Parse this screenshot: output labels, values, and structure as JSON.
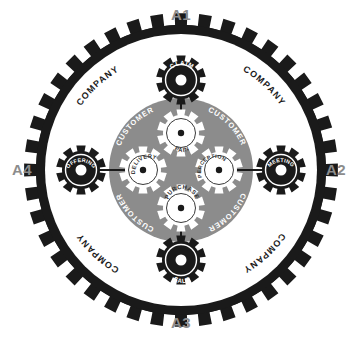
{
  "diagram": {
    "axis_labels": [
      {
        "id": "A1",
        "text": "A1",
        "position": "top"
      },
      {
        "id": "A2",
        "text": "A2",
        "position": "right"
      },
      {
        "id": "A3",
        "text": "A3",
        "position": "bottom"
      },
      {
        "id": "A4",
        "text": "A4",
        "position": "left"
      }
    ],
    "outer_ring": {
      "label": "COMPANY",
      "occurrences": 4,
      "labels": [
        "COMPANY",
        "COMPANY",
        "COMPANY",
        "COMPANY"
      ],
      "color": "#1a1a1a",
      "fill": "#ffffff"
    },
    "inner_ring": {
      "label": "CUSTOMER",
      "occurrences": 4,
      "labels": [
        "CUSTOMER",
        "CUSTOMER",
        "CUSTOMER",
        "CUSTOMER"
      ],
      "color": "#8c8c8c",
      "text_color": "#ffffff"
    },
    "outer_gears": [
      {
        "id": "claim",
        "label": "CLAIM",
        "position": "top",
        "color": "#1a1a1a"
      },
      {
        "id": "meeting",
        "label": "MEETING",
        "position": "right",
        "color": "#1a1a1a"
      },
      {
        "id": "sale",
        "label": "SALE",
        "position": "bottom",
        "color": "#1a1a1a"
      },
      {
        "id": "offering",
        "label": "OFFERING",
        "position": "left",
        "color": "#1a1a1a"
      }
    ],
    "inner_gears": [
      {
        "id": "pain",
        "label": "PAIN",
        "position": "top",
        "color": "#ffffff"
      },
      {
        "id": "perception",
        "label": "PERCEPTION",
        "position": "right",
        "color": "#ffffff"
      },
      {
        "id": "purchase",
        "label": "PURCHASE",
        "position": "bottom",
        "color": "#ffffff"
      },
      {
        "id": "delivery",
        "label": "DELIVERY",
        "position": "left",
        "color": "#ffffff"
      }
    ],
    "colors": {
      "background": "#ffffff",
      "dark": "#1a1a1a",
      "gray": "#8c8c8c",
      "label_gray": "#8c8c8c",
      "white": "#ffffff"
    }
  }
}
